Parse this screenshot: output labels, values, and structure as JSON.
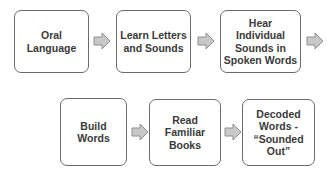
{
  "diagram": {
    "type": "process-flow",
    "colors": {
      "box_border": "#6a6a6a",
      "box_fill": "#ffffff",
      "text": "#3a3a3a",
      "arrow_fill": "#c8c8c8",
      "arrow_stroke": "#8f8f8f"
    },
    "steps": [
      {
        "label": "Oral\nLanguage"
      },
      {
        "label": "Learn Letters\nand Sounds"
      },
      {
        "label": "Hear\nIndividual\nSounds in\nSpoken Words"
      },
      {
        "label": "Build\nWords"
      },
      {
        "label": "Read\nFamiliar\nBooks"
      },
      {
        "label": "Decoded\nWords -\n“Sounded\nOut”"
      }
    ],
    "arrows": [
      {
        "from": 0,
        "to": 1,
        "icon": "right-arrow-icon"
      },
      {
        "from": 1,
        "to": 2,
        "icon": "right-arrow-icon"
      },
      {
        "from": 2,
        "to": 3,
        "icon": "right-arrow-icon"
      },
      {
        "from": 3,
        "to": 4,
        "icon": "right-arrow-icon"
      },
      {
        "from": 4,
        "to": 5,
        "icon": "right-arrow-icon"
      }
    ]
  }
}
